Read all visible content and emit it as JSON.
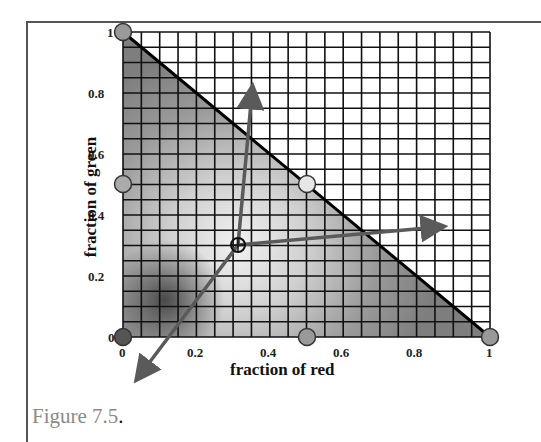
{
  "figure": {
    "caption_text": "Figure 7.5",
    "caption_period": "."
  },
  "axes": {
    "xlabel": "fraction of red",
    "ylabel": "fraction of green",
    "x_ticks": [
      "0",
      "0.2",
      "0.4",
      "0.6",
      "0.8",
      "1"
    ],
    "y_ticks": [
      "0",
      "0.2",
      "0.4",
      "0.6",
      "0.8",
      "1"
    ]
  },
  "diagram": {
    "grid": {
      "columns": 20,
      "rows": 20,
      "x_range": [
        0,
        1
      ],
      "y_range": [
        0,
        1
      ]
    },
    "gamut_triangle": {
      "vertices": [
        [
          0,
          0
        ],
        [
          1,
          0
        ],
        [
          0,
          1
        ]
      ],
      "hypotenuse": "red + green = 1"
    },
    "markers": [
      {
        "name": "origin",
        "x": 0,
        "y": 0,
        "fill": "#555555"
      },
      {
        "name": "red-primary",
        "x": 1,
        "y": 0,
        "fill": "#999999"
      },
      {
        "name": "green-primary",
        "x": 0,
        "y": 1,
        "fill": "#999999"
      },
      {
        "name": "mid-red-axis",
        "x": 0.5,
        "y": 0,
        "fill": "#999999"
      },
      {
        "name": "mid-green-axis",
        "x": 0,
        "y": 0.5,
        "fill": "#999999"
      },
      {
        "name": "mid-hypotenuse",
        "x": 0.5,
        "y": 0.5,
        "fill": "#dddddd"
      }
    ],
    "center_point": {
      "name": "white-point",
      "x": 0.33,
      "y": 0.33,
      "symbol": "circle-plus"
    },
    "arrows": [
      {
        "name": "toward-green",
        "from": [
          0.33,
          0.33
        ],
        "to": [
          0.37,
          0.83
        ]
      },
      {
        "name": "toward-red",
        "from": [
          0.33,
          0.33
        ],
        "to": [
          0.88,
          0.37
        ]
      },
      {
        "name": "toward-blue",
        "from": [
          0.33,
          0.33
        ],
        "to": [
          0.03,
          -0.15
        ]
      }
    ],
    "colors": {
      "grid_line": "#111111",
      "arrow": "#5a5a5a",
      "triangle_dark": "#4a4a4a",
      "triangle_light": "#e8e8e8"
    }
  }
}
